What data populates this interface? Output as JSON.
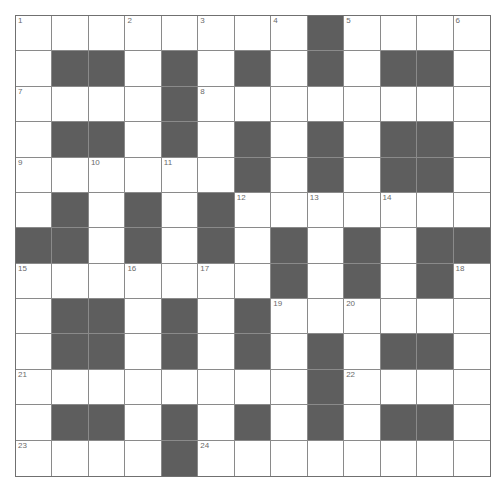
{
  "puzzle": {
    "rows": 13,
    "cols": 13,
    "layout": [
      "........#....",
      ".##.#.#.#.##.",
      "....#........",
      ".##.#.#.#.##.",
      "......#.#.##.",
      ".#.#.#.......",
      "##.#.#.#.#.##",
      ".......#.#.#.",
      ".##.#.#......",
      ".##.#.#.#.##.",
      "........#....",
      ".##.#.#.#.##.",
      "....#........"
    ],
    "numbers": [
      {
        "r": 0,
        "c": 0,
        "n": "1"
      },
      {
        "r": 0,
        "c": 3,
        "n": "2"
      },
      {
        "r": 0,
        "c": 5,
        "n": "3"
      },
      {
        "r": 0,
        "c": 7,
        "n": "4"
      },
      {
        "r": 0,
        "c": 9,
        "n": "5"
      },
      {
        "r": 0,
        "c": 12,
        "n": "6"
      },
      {
        "r": 2,
        "c": 0,
        "n": "7"
      },
      {
        "r": 2,
        "c": 5,
        "n": "8"
      },
      {
        "r": 4,
        "c": 0,
        "n": "9"
      },
      {
        "r": 4,
        "c": 2,
        "n": "10"
      },
      {
        "r": 4,
        "c": 4,
        "n": "11"
      },
      {
        "r": 5,
        "c": 6,
        "n": "12"
      },
      {
        "r": 5,
        "c": 8,
        "n": "13"
      },
      {
        "r": 5,
        "c": 10,
        "n": "14"
      },
      {
        "r": 7,
        "c": 0,
        "n": "15"
      },
      {
        "r": 7,
        "c": 3,
        "n": "16"
      },
      {
        "r": 7,
        "c": 5,
        "n": "17"
      },
      {
        "r": 7,
        "c": 12,
        "n": "18"
      },
      {
        "r": 8,
        "c": 7,
        "n": "19"
      },
      {
        "r": 8,
        "c": 9,
        "n": "20"
      },
      {
        "r": 10,
        "c": 0,
        "n": "21"
      },
      {
        "r": 10,
        "c": 9,
        "n": "22"
      },
      {
        "r": 12,
        "c": 0,
        "n": "23"
      },
      {
        "r": 12,
        "c": 5,
        "n": "24"
      }
    ],
    "colors": {
      "block": "#5e5e5e",
      "line": "#8a8a8a",
      "number": "#6a6a6a"
    }
  }
}
